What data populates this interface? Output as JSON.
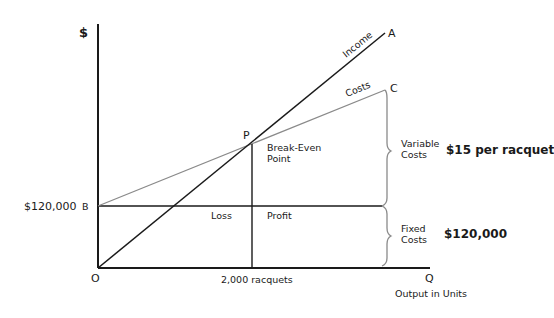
{
  "diagram": {
    "y_axis_symbol": "$",
    "x_axis_label": "Output in Units",
    "points": {
      "origin": "O",
      "q": "Q",
      "a": "A",
      "b": "B",
      "c": "C",
      "p": "P"
    },
    "lines": {
      "income": "Income",
      "costs": "Costs"
    },
    "break_even_label_line1": "Break-Even",
    "break_even_label_line2": "Point",
    "fixed_cost_axis_value": "$120,000",
    "break_even_quantity": "2,000 racquets",
    "regions": {
      "loss": "Loss",
      "profit": "Profit"
    },
    "brackets": {
      "variable_costs_line1": "Variable",
      "variable_costs_line2": "Costs",
      "variable_costs_value": "$15 per racquet",
      "fixed_costs_line1": "Fixed",
      "fixed_costs_line2": "Costs",
      "fixed_costs_value": "$120,000"
    },
    "colors": {
      "axis": "#1a1a1a",
      "income_line": "#1a1a1a",
      "costs_line": "#8a8a8a",
      "bracket": "#8a8a8a",
      "text": "#1a1a1a"
    }
  }
}
